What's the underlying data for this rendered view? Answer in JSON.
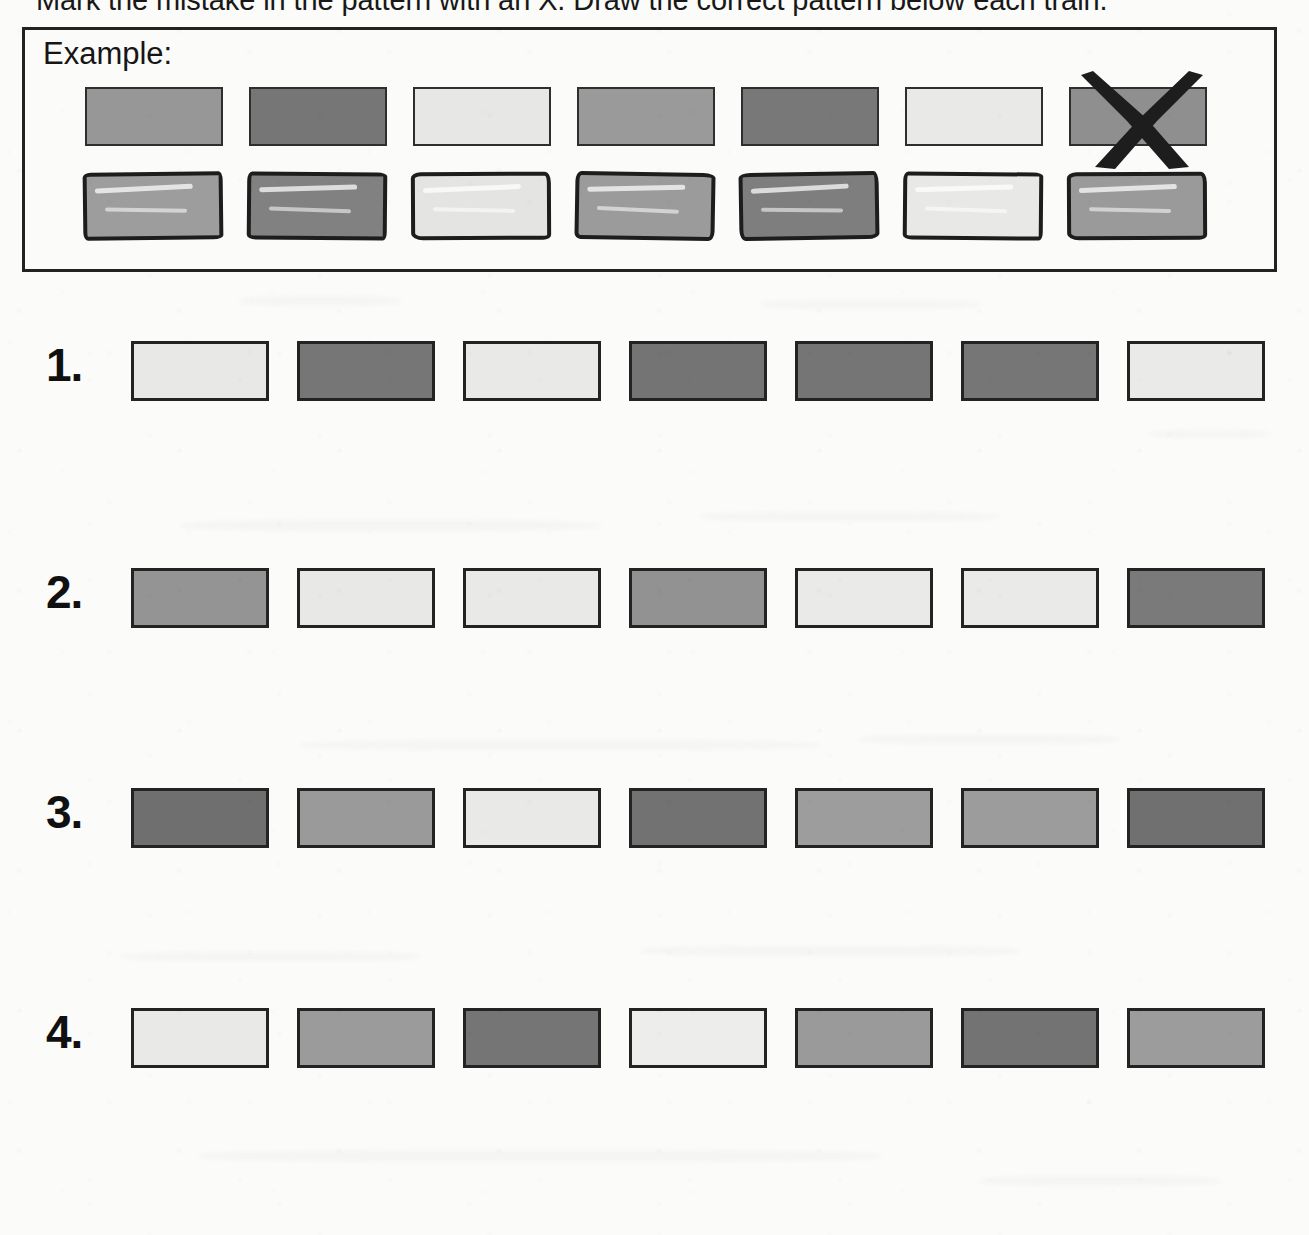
{
  "worksheet": {
    "instruction": "Mark the mistake in the pattern with an X. Draw the correct pattern below each train.",
    "example_label": "Example:"
  },
  "palette": {
    "light": "#e6e6e4",
    "light_alt": "#e9e9e7",
    "medium": "#9b9b9b",
    "medium_dark": "#848484",
    "dark": "#757575",
    "darker": "#6d6d6d",
    "outline": "#232323",
    "ink": "#1d1d1d",
    "paper": "#fbfbf9"
  },
  "example": {
    "printed_train": {
      "name": "example-printed-train",
      "blocks": [
        {
          "shade": "medium",
          "color": "#979797",
          "marked": false
        },
        {
          "shade": "dark",
          "color": "#767676",
          "marked": false
        },
        {
          "shade": "light",
          "color": "#e7e7e5",
          "marked": false
        },
        {
          "shade": "medium",
          "color": "#9a9a9a",
          "marked": false
        },
        {
          "shade": "dark",
          "color": "#787878",
          "marked": false
        },
        {
          "shade": "light",
          "color": "#e9e9e7",
          "marked": false
        },
        {
          "shade": "medium",
          "color": "#8f8f8f",
          "marked": true
        }
      ],
      "mistake_position": 7,
      "mark": "X"
    },
    "drawn_train": {
      "name": "example-drawn-train",
      "blocks": [
        {
          "shade": "medium",
          "color": "#9d9d9d"
        },
        {
          "shade": "dark",
          "color": "#818181"
        },
        {
          "shade": "light",
          "color": "#e4e4e2"
        },
        {
          "shade": "medium",
          "color": "#9b9b9b"
        },
        {
          "shade": "dark",
          "color": "#7e7e7e"
        },
        {
          "shade": "light",
          "color": "#e8e8e6"
        },
        {
          "shade": "medium",
          "color": "#9a9a9a"
        }
      ]
    }
  },
  "problems": [
    {
      "number": "1.",
      "name": "problem-row-1",
      "blocks": [
        {
          "shade": "light",
          "color": "#e8e8e6"
        },
        {
          "shade": "dark",
          "color": "#767676"
        },
        {
          "shade": "light",
          "color": "#e9e9e7"
        },
        {
          "shade": "dark",
          "color": "#747474"
        },
        {
          "shade": "dark",
          "color": "#757575"
        },
        {
          "shade": "dark",
          "color": "#767676"
        },
        {
          "shade": "light",
          "color": "#eaeae8"
        }
      ]
    },
    {
      "number": "2.",
      "name": "problem-row-2",
      "blocks": [
        {
          "shade": "medium",
          "color": "#949494"
        },
        {
          "shade": "light",
          "color": "#e8e8e6"
        },
        {
          "shade": "light",
          "color": "#e9e9e7"
        },
        {
          "shade": "medium",
          "color": "#929292"
        },
        {
          "shade": "light",
          "color": "#eaeae8"
        },
        {
          "shade": "light",
          "color": "#eaeae8"
        },
        {
          "shade": "medium_dark",
          "color": "#7a7a7a"
        }
      ]
    },
    {
      "number": "3.",
      "name": "problem-row-3",
      "blocks": [
        {
          "shade": "dark",
          "color": "#6f6f6f"
        },
        {
          "shade": "medium",
          "color": "#9a9a9a"
        },
        {
          "shade": "light",
          "color": "#e9e9e7"
        },
        {
          "shade": "dark",
          "color": "#727272"
        },
        {
          "shade": "medium",
          "color": "#9d9d9d"
        },
        {
          "shade": "medium",
          "color": "#9c9c9c"
        },
        {
          "shade": "dark",
          "color": "#707070"
        }
      ]
    },
    {
      "number": "4.",
      "name": "problem-row-4",
      "blocks": [
        {
          "shade": "light",
          "color": "#e9e9e7"
        },
        {
          "shade": "medium",
          "color": "#9b9b9b"
        },
        {
          "shade": "dark",
          "color": "#757575"
        },
        {
          "shade": "light",
          "color": "#ededeb"
        },
        {
          "shade": "medium",
          "color": "#9a9a9a"
        },
        {
          "shade": "dark",
          "color": "#737373"
        },
        {
          "shade": "medium",
          "color": "#9c9c9c"
        }
      ]
    }
  ]
}
